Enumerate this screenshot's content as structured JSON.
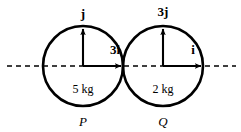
{
  "figure": {
    "background": "#ffffff",
    "stroke_color": "#000000",
    "axis": {
      "label": "horizontal-dashed-axis",
      "y": 66,
      "x_start": 7,
      "x_end": 236,
      "dash": "5,4",
      "width": 1.6
    }
  },
  "bodies": [
    {
      "id": "P",
      "name": "P",
      "mass_label": "5 kg",
      "cx": 83,
      "cy": 66,
      "r": 40,
      "vertical_vector": {
        "label": "j",
        "tip_y": 27
      },
      "horizontal_vector": {
        "label": "3i",
        "tip_x": 124
      }
    },
    {
      "id": "Q",
      "name": "Q",
      "mass_label": "2 kg",
      "cx": 163,
      "cy": 66,
      "r": 40,
      "vertical_vector": {
        "label": "3j",
        "tip_y": 27
      },
      "horizontal_vector": {
        "label": "i",
        "tip_x": 204
      }
    }
  ],
  "labels": {
    "left_vertical": "j",
    "left_horizontal": "3i",
    "left_mass": "5 kg",
    "left_body": "P",
    "right_vertical": "3j",
    "right_horizontal": "i",
    "right_mass": "2 kg",
    "right_body": "Q"
  }
}
